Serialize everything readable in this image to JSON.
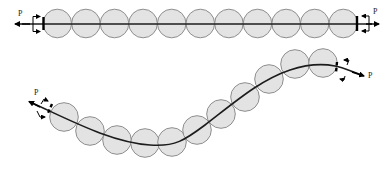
{
  "figure": {
    "colors": {
      "bead_fill": "#e3e3e3",
      "bead_stroke": "#8e8e8e",
      "rod": "#1c1c1c"
    },
    "straight_chain": {
      "bead_count": 11,
      "load_label_left": "P",
      "load_label_right": "P"
    },
    "buckled_chain": {
      "bead_count": 11,
      "load_label_left": "P",
      "load_label_right": "P"
    }
  }
}
